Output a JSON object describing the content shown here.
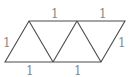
{
  "diagram": {
    "type": "geometry",
    "vertices": {
      "A": [
        5,
        62
      ],
      "B": [
        29,
        21
      ],
      "C": [
        53,
        62
      ],
      "D": [
        77,
        21
      ],
      "E": [
        101,
        62
      ],
      "F": [
        125,
        21
      ]
    },
    "edges": [
      [
        "A",
        "B"
      ],
      [
        "B",
        "C"
      ],
      [
        "C",
        "D"
      ],
      [
        "D",
        "E"
      ],
      [
        "E",
        "F"
      ],
      [
        "A",
        "C"
      ],
      [
        "C",
        "E"
      ],
      [
        "B",
        "D"
      ],
      [
        "D",
        "F"
      ]
    ],
    "labels": [
      {
        "text": "1",
        "x": 51,
        "y": 18,
        "edge": "top-left"
      },
      {
        "text": "1",
        "x": 99,
        "y": 18,
        "edge": "top-right"
      },
      {
        "text": "1",
        "x": 5,
        "y": 46,
        "edge": "left"
      },
      {
        "text": "1",
        "x": 119,
        "y": 46,
        "edge": "right"
      },
      {
        "text": "1",
        "x": 27,
        "y": 75,
        "edge": "bottom-left"
      },
      {
        "text": "1",
        "x": 75,
        "y": 75,
        "edge": "bottom-right"
      }
    ],
    "colors": {
      "line": "#4a4a4a",
      "label": "#8a8a8a"
    }
  }
}
